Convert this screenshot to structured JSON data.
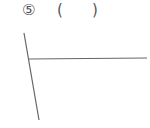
{
  "problem": {
    "number_label": "⑤",
    "open_paren": "(",
    "close_paren": ")",
    "answer": ""
  },
  "figure": {
    "type": "two intersecting lines (angle)",
    "line_color": "#666666",
    "lines": [
      {
        "name": "slanted",
        "x1": 24,
        "y1": 33,
        "x2": 39,
        "y2": 120
      },
      {
        "name": "horizontal",
        "x1": 29,
        "y1": 59,
        "x2": 147,
        "y2": 58
      }
    ]
  }
}
